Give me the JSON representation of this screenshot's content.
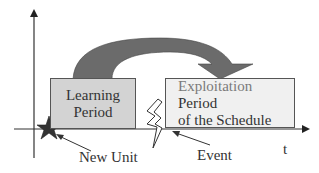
{
  "diagram": {
    "boxes": {
      "learning": {
        "line1": "Learning",
        "line2": "Period",
        "fill": "#d3d3d3"
      },
      "exploitation": {
        "line1_highlight": "Exploitation",
        "line1_rest": " Period",
        "line2": "of the Schedule",
        "fill": "#f0f0f0"
      }
    },
    "labels": {
      "new_unit": "New Unit",
      "event": "Event",
      "time_axis": "t"
    },
    "icons": {
      "star": "star-icon",
      "lightning": "lightning-bolt-icon",
      "curved_arrow": "curved-arrow-icon"
    },
    "colors": {
      "arrow_fill": "#6b6b6b",
      "axis": "#333333"
    }
  }
}
